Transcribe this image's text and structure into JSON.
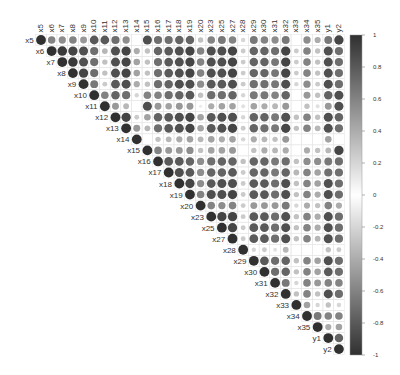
{
  "chart_data": {
    "type": "heatmap",
    "subtype": "corrplot-upper-circle",
    "title": "",
    "variables": [
      "x5",
      "x6",
      "x7",
      "x8",
      "x9",
      "x10",
      "x11",
      "x12",
      "x13",
      "x14",
      "x15",
      "x16",
      "x17",
      "x18",
      "x19",
      "x20",
      "x23",
      "x25",
      "x27",
      "x28",
      "x29",
      "x30",
      "x31",
      "x32",
      "x33",
      "x34",
      "x35",
      "y1",
      "y2"
    ],
    "colorbar": {
      "ticks": [
        "1",
        "0.8",
        "0.6",
        "0.4",
        "0.2",
        "0",
        "-0.2",
        "-0.4",
        "-0.6",
        "-0.8",
        "-1"
      ],
      "range": [
        -1,
        1
      ],
      "low_color": "#303030",
      "mid_color": "#ffffff",
      "high_color": "#303030"
    },
    "grid": true,
    "legend_position": "right",
    "matrix_upper_rows": [
      [
        1.0,
        0.6,
        0.55,
        0.6,
        0.5,
        0.8,
        0.8,
        0.7,
        0.55,
        0.0,
        0.85,
        0.7,
        0.7,
        0.75,
        0.75,
        0.3,
        0.6,
        0.65,
        0.6,
        0.2,
        0.65,
        0.6,
        0.55,
        0.65,
        0.0,
        0.55,
        0.4,
        0.65,
        0.9
      ],
      [
        1.0,
        0.95,
        0.9,
        0.85,
        0.7,
        0.35,
        0.85,
        0.9,
        0.4,
        0.3,
        0.75,
        0.8,
        0.85,
        0.9,
        0.6,
        0.85,
        0.85,
        0.9,
        0.25,
        0.75,
        0.75,
        0.7,
        0.9,
        0.25,
        0.6,
        0.3,
        0.85,
        0.7
      ],
      [
        1.0,
        0.95,
        0.85,
        0.7,
        0.3,
        0.85,
        0.9,
        0.45,
        0.3,
        0.7,
        0.8,
        0.85,
        0.9,
        0.6,
        0.85,
        0.85,
        0.9,
        0.25,
        0.75,
        0.75,
        0.65,
        0.9,
        0.25,
        0.6,
        0.3,
        0.85,
        0.7
      ],
      [
        1.0,
        0.9,
        0.7,
        0.3,
        0.85,
        0.9,
        0.45,
        0.3,
        0.7,
        0.8,
        0.85,
        0.9,
        0.6,
        0.85,
        0.85,
        0.9,
        0.25,
        0.75,
        0.75,
        0.65,
        0.9,
        0.25,
        0.6,
        0.3,
        0.85,
        0.7
      ],
      [
        1.0,
        0.65,
        0.25,
        0.8,
        0.85,
        0.4,
        0.3,
        0.7,
        0.75,
        0.85,
        0.85,
        0.55,
        0.8,
        0.8,
        0.85,
        0.25,
        0.7,
        0.7,
        0.65,
        0.85,
        0.2,
        0.55,
        0.25,
        0.85,
        0.7
      ],
      [
        1.0,
        0.6,
        0.75,
        0.7,
        0.2,
        0.6,
        0.6,
        0.7,
        0.75,
        0.8,
        0.3,
        0.7,
        0.7,
        0.75,
        0.2,
        0.65,
        0.65,
        0.6,
        0.75,
        0.0,
        0.5,
        0.3,
        0.75,
        0.85
      ],
      [
        1.0,
        0.5,
        0.35,
        0.0,
        0.85,
        0.5,
        0.45,
        0.5,
        0.5,
        0.1,
        0.4,
        0.45,
        0.45,
        0.15,
        0.45,
        0.4,
        0.35,
        0.5,
        0.0,
        0.3,
        0.15,
        0.5,
        0.85
      ],
      [
        1.0,
        0.9,
        0.25,
        0.45,
        0.75,
        0.8,
        0.85,
        0.9,
        0.45,
        0.8,
        0.85,
        0.85,
        0.2,
        0.75,
        0.75,
        0.65,
        0.85,
        0.3,
        0.6,
        0.3,
        0.85,
        0.75
      ],
      [
        1.0,
        0.5,
        0.35,
        0.7,
        0.8,
        0.85,
        0.9,
        0.45,
        0.8,
        0.85,
        0.9,
        0.25,
        0.75,
        0.7,
        0.65,
        0.9,
        0.3,
        0.6,
        0.35,
        0.85,
        0.7
      ],
      [
        1.0,
        0.0,
        0.3,
        0.35,
        0.4,
        0.45,
        0.35,
        0.45,
        0.4,
        0.45,
        0.2,
        0.4,
        0.35,
        0.3,
        0.5,
        0.0,
        0.0,
        0.0,
        0.45,
        0.0
      ],
      [
        1.0,
        0.6,
        0.5,
        0.5,
        0.55,
        0.3,
        0.45,
        0.45,
        0.5,
        0.0,
        0.3,
        0.4,
        0.35,
        0.4,
        0.0,
        0.4,
        0.3,
        0.35,
        0.9
      ],
      [
        1.0,
        0.8,
        0.8,
        0.75,
        0.55,
        0.7,
        0.75,
        0.75,
        0.3,
        0.75,
        0.75,
        0.65,
        0.7,
        0.3,
        0.55,
        0.55,
        0.65,
        0.7
      ],
      [
        1.0,
        0.85,
        0.8,
        0.55,
        0.75,
        0.75,
        0.8,
        0.25,
        0.75,
        0.75,
        0.65,
        0.75,
        0.35,
        0.6,
        0.45,
        0.7,
        0.7
      ],
      [
        1.0,
        0.9,
        0.55,
        0.8,
        0.85,
        0.85,
        0.25,
        0.8,
        0.8,
        0.7,
        0.85,
        0.3,
        0.6,
        0.45,
        0.85,
        0.7
      ],
      [
        1.0,
        0.6,
        0.85,
        0.85,
        0.9,
        0.25,
        0.8,
        0.8,
        0.7,
        0.85,
        0.3,
        0.6,
        0.4,
        0.85,
        0.7
      ],
      [
        1.0,
        0.6,
        0.55,
        0.6,
        0.25,
        0.5,
        0.5,
        0.5,
        0.65,
        0.2,
        0.4,
        0.3,
        0.6,
        0.4
      ],
      [
        1.0,
        0.9,
        0.9,
        0.25,
        0.8,
        0.8,
        0.7,
        0.85,
        0.3,
        0.6,
        0.4,
        0.85,
        0.7
      ],
      [
        1.0,
        0.9,
        0.25,
        0.8,
        0.8,
        0.7,
        0.85,
        0.3,
        0.6,
        0.4,
        0.85,
        0.7
      ],
      [
        1.0,
        0.25,
        0.8,
        0.8,
        0.7,
        0.85,
        0.3,
        0.6,
        0.35,
        0.85,
        0.7
      ],
      [
        1.0,
        0.2,
        0.25,
        0.15,
        0.35,
        0.0,
        0.0,
        0.0,
        0.3,
        0.25
      ],
      [
        1.0,
        0.8,
        0.7,
        0.75,
        0.3,
        0.6,
        0.45,
        0.85,
        0.7
      ],
      [
        1.0,
        0.7,
        0.75,
        0.3,
        0.6,
        0.45,
        0.8,
        0.7
      ],
      [
        1.0,
        0.65,
        0.2,
        0.6,
        0.5,
        0.6,
        0.6
      ],
      [
        1.0,
        0.3,
        0.6,
        0.3,
        0.85,
        0.7
      ],
      [
        1.0,
        0.45,
        0.2,
        0.3,
        0.2
      ],
      [
        1.0,
        0.65,
        0.6,
        0.6
      ],
      [
        1.0,
        0.4,
        0.45
      ],
      [
        1.0,
        0.75
      ],
      [
        1.0
      ]
    ]
  }
}
